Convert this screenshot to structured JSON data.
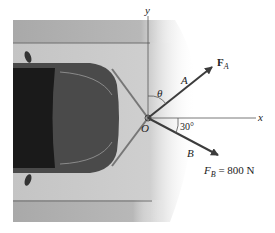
{
  "figure": {
    "type": "statics free-body diagram",
    "axes": {
      "x_label": "x",
      "y_label": "y",
      "origin_label": "O"
    },
    "forces": [
      {
        "name": "F_A",
        "symbol": "F",
        "subscript": "A",
        "cable_label": "A",
        "angle_label": "θ",
        "angle_reference": "y-axis"
      },
      {
        "name": "F_B",
        "symbol": "F",
        "subscript": "B",
        "cable_label": "B",
        "magnitude_text": "= 800 N",
        "angle_label": "30°",
        "angle_reference": "x-axis"
      }
    ],
    "colors": {
      "road": "#c9c9c9",
      "road_dark": "#a8a8a8",
      "lane_line": "#6e6e6e",
      "arrow": "#3c3c3c",
      "car_body": "#4a4a4a",
      "axis": "#555555"
    }
  }
}
